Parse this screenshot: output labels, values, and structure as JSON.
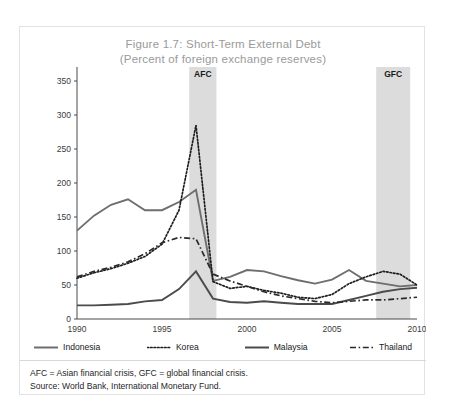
{
  "figure": {
    "title_line1": "Figure 1.7: Short-Term External Debt",
    "title_line2": "(Percent of foreign exchange reserves)",
    "footnote1": "AFC = Asian financial crisis, GFC = global financial crisis.",
    "footnote2": "Source: World Bank, International Monetary Fund."
  },
  "bands": [
    {
      "label": "AFC",
      "start": 1996.6,
      "end": 1998.2
    },
    {
      "label": "GFC",
      "start": 2007.6,
      "end": 2009.6
    }
  ],
  "legend": [
    {
      "name": "Indonesia",
      "style": "solid",
      "color": "#6e6e6e"
    },
    {
      "name": "Korea",
      "style": "dotted",
      "color": "#1e1e1e"
    },
    {
      "name": "Malaysia",
      "style": "solid",
      "color": "#4b4b4b"
    },
    {
      "name": "Thailand",
      "style": "dashdot",
      "color": "#2a2a2a"
    }
  ],
  "chart_data": {
    "type": "line",
    "title": "Figure 1.7: Short-Term External Debt (Percent of foreign exchange reserves)",
    "xlabel": "",
    "ylabel": "Percent of foreign exchange reserves",
    "xlim": [
      1990,
      2010
    ],
    "ylim": [
      0,
      350
    ],
    "yticks": [
      0,
      50,
      100,
      150,
      200,
      250,
      300,
      350
    ],
    "xticks": [
      1990,
      1995,
      2000,
      2005,
      2010
    ],
    "grid": false,
    "legend_position": "bottom",
    "x": [
      1990,
      1991,
      1992,
      1993,
      1994,
      1995,
      1996,
      1997,
      1998,
      1999,
      2000,
      2001,
      2002,
      2003,
      2004,
      2005,
      2006,
      2007,
      2008,
      2009,
      2010
    ],
    "series": [
      {
        "name": "Indonesia",
        "values": [
          130,
          152,
          168,
          176,
          160,
          160,
          172,
          190,
          56,
          62,
          72,
          70,
          63,
          57,
          52,
          58,
          72,
          56,
          52,
          48,
          50
        ]
      },
      {
        "name": "Korea",
        "values": [
          60,
          68,
          74,
          82,
          92,
          110,
          160,
          285,
          55,
          45,
          48,
          42,
          38,
          32,
          30,
          36,
          52,
          62,
          70,
          66,
          50
        ]
      },
      {
        "name": "Malaysia",
        "values": [
          20,
          20,
          21,
          22,
          26,
          28,
          44,
          70,
          30,
          25,
          24,
          26,
          24,
          22,
          22,
          22,
          28,
          34,
          40,
          44,
          46
        ]
      },
      {
        "name": "Thailand",
        "values": [
          62,
          70,
          76,
          84,
          96,
          112,
          120,
          118,
          66,
          56,
          48,
          40,
          34,
          30,
          26,
          24,
          26,
          28,
          28,
          30,
          32
        ]
      }
    ],
    "annotations": [
      {
        "text": "AFC",
        "x_start": 1996.6,
        "x_end": 1998.2,
        "type": "shaded-band"
      },
      {
        "text": "GFC",
        "x_start": 2007.6,
        "x_end": 2009.6,
        "type": "shaded-band"
      }
    ]
  }
}
